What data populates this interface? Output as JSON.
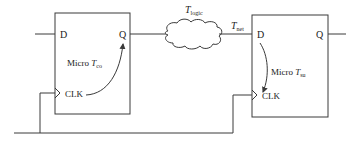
{
  "diagram": {
    "title": "",
    "colors": {
      "stroke": "#3a3a3a",
      "text": "#222222",
      "background": "#ffffff"
    },
    "flipflop_left": {
      "d_label": "D",
      "q_label": "Q",
      "clk_label": "CLK",
      "micro_prefix": "Micro ",
      "micro_T": "T",
      "micro_sub": "co"
    },
    "flipflop_right": {
      "d_label": "D",
      "q_label": "Q",
      "clk_label": "CLK",
      "micro_prefix": "Micro ",
      "micro_T": "T",
      "micro_sub": "su"
    },
    "logic_cloud": {
      "T": "T",
      "sub": "logic"
    },
    "net": {
      "T": "T",
      "sub": "net"
    }
  }
}
